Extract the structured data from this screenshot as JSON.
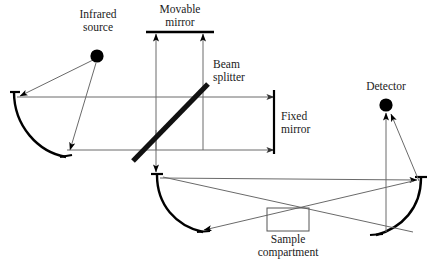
{
  "figure": {
    "type": "optical-schematic",
    "background_color": "#ffffff",
    "line_color": "#555555",
    "emphasis_color": "#000000",
    "text_color": "#1a1a1a"
  },
  "labels": {
    "infrared_source": "Infrared\nsource",
    "movable_mirror": "Movable\nmirror",
    "beam_splitter": "Beam\nsplitter",
    "fixed_mirror": "Fixed\nmirror",
    "detector": "Detector",
    "sample_compartment": "Sample\ncompartment"
  },
  "components": [
    {
      "name": "infrared-source",
      "label": "Infrared source",
      "shape": "filled-circle",
      "x": 97,
      "y": 56,
      "r": 6.5,
      "color": "#000000"
    },
    {
      "name": "detector",
      "label": "Detector",
      "shape": "filled-circle",
      "x": 386,
      "y": 105,
      "r": 6.5,
      "color": "#000000"
    },
    {
      "name": "movable-mirror",
      "label": "Movable mirror",
      "shape": "horizontal-line",
      "x1": 147,
      "x2": 213,
      "y": 32,
      "color": "#000000"
    },
    {
      "name": "fixed-mirror",
      "label": "Fixed mirror",
      "shape": "vertical-line",
      "x": 274,
      "y1": 92,
      "y2": 152,
      "color": "#000000"
    },
    {
      "name": "beam-splitter",
      "label": "Beam splitter",
      "shape": "thick-diagonal",
      "x1": 133,
      "y1": 160,
      "x2": 207,
      "y2": 85,
      "color": "#000000"
    },
    {
      "name": "sample-compartment",
      "label": "Sample compartment",
      "shape": "rectangle",
      "x": 267,
      "y": 208,
      "width": 42,
      "height": 23,
      "color": "#555555"
    },
    {
      "name": "left-collimating-mirror",
      "label": "Left concave mirror",
      "shape": "arc",
      "color": "#000000"
    },
    {
      "name": "lower-left-focusing-mirror",
      "label": "Lower left concave mirror",
      "shape": "arc",
      "color": "#000000"
    },
    {
      "name": "right-focusing-mirror",
      "label": "Right concave mirror",
      "shape": "arc",
      "color": "#000000"
    }
  ],
  "beam_paths": [
    {
      "name": "source-to-left-mirror",
      "from": "infrared-source",
      "to": "left-collimating-mirror",
      "arrow": true
    },
    {
      "name": "left-mirror-to-beamsplitter-upper",
      "from": "left-collimating-mirror",
      "to": "beam-splitter",
      "arrow": false
    },
    {
      "name": "source-to-lower-beam",
      "from": "infrared-source",
      "to": "lower-left-focusing-mirror",
      "arrow": true
    },
    {
      "name": "beamsplitter-to-movable-mirror",
      "from": "beam-splitter",
      "to": "movable-mirror",
      "arrow": true
    },
    {
      "name": "beamsplitter-to-fixed-mirror-upper",
      "from": "beam-splitter",
      "to": "fixed-mirror",
      "arrow": true
    },
    {
      "name": "beamsplitter-to-fixed-mirror-lower",
      "from": "beam-splitter",
      "to": "fixed-mirror",
      "arrow": true
    },
    {
      "name": "beamsplitter-down-to-lower-mirror",
      "from": "beam-splitter",
      "to": "lower-left-focusing-mirror",
      "arrow": true
    },
    {
      "name": "lower-mirror-through-sample",
      "from": "lower-left-focusing-mirror",
      "to": "right-focusing-mirror",
      "arrow": true
    },
    {
      "name": "right-mirror-to-detector",
      "from": "right-focusing-mirror",
      "to": "detector",
      "arrow": true
    }
  ]
}
